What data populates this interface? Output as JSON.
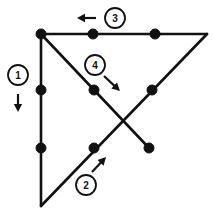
{
  "figure": {
    "type": "line-diagram",
    "width": 214,
    "height": 210,
    "background_color": "#ffffff",
    "stroke_color": "#111111",
    "vertices": [
      {
        "id": "A",
        "name": "top-left-corner",
        "x": 41,
        "y": 34
      },
      {
        "id": "B",
        "name": "top-right-corner",
        "x": 207,
        "y": 34
      },
      {
        "id": "C",
        "name": "bottom-left-corner",
        "x": 41,
        "y": 206
      },
      {
        "id": "D",
        "name": "short-diagonal-end",
        "x": 149,
        "y": 148
      },
      {
        "id": "X",
        "name": "diagonal-crossing-point",
        "x": 125,
        "y": 120
      }
    ],
    "edges": [
      {
        "id": "e-top",
        "name": "top-horizontal-edge",
        "from": "A",
        "to": "B"
      },
      {
        "id": "e-left",
        "name": "left-vertical-edge",
        "from": "A",
        "to": "C"
      },
      {
        "id": "e-desc",
        "name": "descending-diagonal-edge",
        "from": "A",
        "to": "D"
      },
      {
        "id": "e-asc",
        "name": "ascending-diagonal-edge",
        "from": "C",
        "to": "B"
      }
    ],
    "dots": [
      {
        "name": "dot-top-left-vertex",
        "x": 41,
        "y": 34,
        "r": 5
      },
      {
        "name": "dot-top-edge-first",
        "x": 93,
        "y": 34,
        "r": 5
      },
      {
        "name": "dot-top-edge-second",
        "x": 155,
        "y": 34,
        "r": 5
      },
      {
        "name": "dot-left-edge-upper",
        "x": 41,
        "y": 90,
        "r": 5
      },
      {
        "name": "dot-left-edge-lower",
        "x": 41,
        "y": 148,
        "r": 5
      },
      {
        "name": "dot-descending-diagonal-mid",
        "x": 94,
        "y": 90,
        "r": 5
      },
      {
        "name": "dot-descending-diagonal-end",
        "x": 149,
        "y": 148,
        "r": 5
      },
      {
        "name": "dot-ascending-diagonal-upper",
        "x": 152,
        "y": 90,
        "r": 5
      },
      {
        "name": "dot-ascending-diagonal-lower",
        "x": 94,
        "y": 148,
        "r": 5
      }
    ],
    "labels": [
      {
        "id": "L1",
        "text": "1",
        "name": "step-label-1",
        "cx": 18,
        "cy": 75,
        "r": 10,
        "arrow": {
          "name": "arrow-down",
          "direction": "down",
          "x1": 18,
          "y1": 94,
          "x2": 18,
          "y2": 112
        }
      },
      {
        "id": "L2",
        "text": "2",
        "name": "step-label-2",
        "cx": 86,
        "cy": 185,
        "r": 10,
        "arrow": {
          "name": "arrow-up-right",
          "direction": "up-right",
          "x1": 92,
          "y1": 172,
          "x2": 106,
          "y2": 157
        }
      },
      {
        "id": "L3",
        "text": "3",
        "name": "step-label-3",
        "cx": 115,
        "cy": 18,
        "r": 10,
        "arrow": {
          "name": "arrow-left",
          "direction": "left",
          "x1": 96,
          "y1": 18,
          "x2": 77,
          "y2": 18
        }
      },
      {
        "id": "L4",
        "text": "4",
        "name": "step-label-4",
        "cx": 95,
        "cy": 65,
        "r": 10,
        "arrow": {
          "name": "arrow-down-right",
          "direction": "down-right",
          "x1": 104,
          "y1": 76,
          "x2": 120,
          "y2": 91
        }
      }
    ]
  }
}
